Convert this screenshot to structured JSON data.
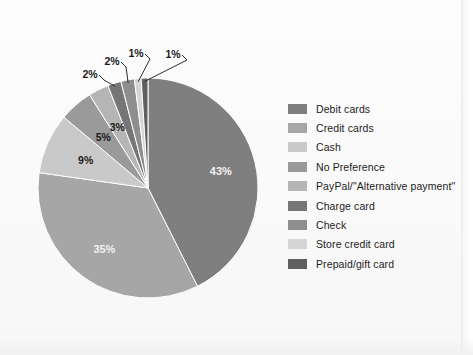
{
  "chart_data": {
    "type": "pie",
    "title": "",
    "legend_position": "right",
    "categories": [
      "Debit cards",
      "Credit cards",
      "Cash",
      "No Preference",
      "PayPal/\"Alternative payment\"",
      "Charge card",
      "Check",
      "Store credit card",
      "Prepaid/gift card"
    ],
    "values": [
      43,
      35,
      9,
      5,
      3,
      2,
      2,
      1,
      1
    ],
    "value_labels": [
      "43%",
      "35%",
      "9%",
      "5%",
      "3%",
      "2%",
      "2%",
      "1%",
      "1%"
    ],
    "colors": [
      "#7f7f7f",
      "#a6a6a6",
      "#c9c9c9",
      "#9a9a9a",
      "#b5b5b5",
      "#767676",
      "#8e8e8e",
      "#d5d5d5",
      "#5f5f5f"
    ],
    "label_placement": [
      "inside",
      "inside",
      "outside",
      "outside",
      "outside",
      "outside",
      "outside",
      "outside",
      "outside"
    ],
    "start_angle_deg": 0,
    "direction": "clockwise",
    "units": "percent",
    "total": 100
  },
  "legend": {
    "items": [
      {
        "label": "Debit cards",
        "color": "#7f7f7f"
      },
      {
        "label": "Credit cards",
        "color": "#a6a6a6"
      },
      {
        "label": "Cash",
        "color": "#c9c9c9"
      },
      {
        "label": "No Preference",
        "color": "#9a9a9a"
      },
      {
        "label": "PayPal/\"Alternative payment\"",
        "color": "#b5b5b5"
      },
      {
        "label": "Charge card",
        "color": "#767676"
      },
      {
        "label": "Check",
        "color": "#8e8e8e"
      },
      {
        "label": "Store credit card",
        "color": "#d5d5d5"
      },
      {
        "label": "Prepaid/gift card",
        "color": "#5f5f5f"
      }
    ]
  },
  "geometry": {
    "cx": 148,
    "cy": 188,
    "r": 110
  }
}
